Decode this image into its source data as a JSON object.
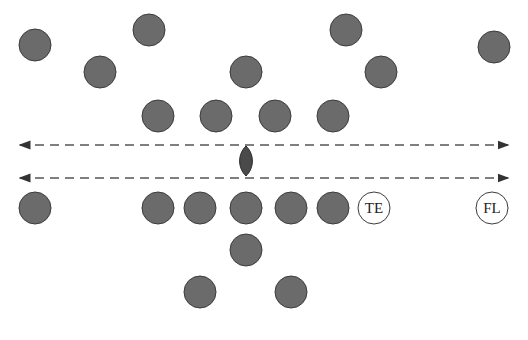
{
  "diagram": {
    "type": "football-formation",
    "colors": {
      "player_fill": "#6b6b6b",
      "player_border": "#3c3c3c",
      "line": "#555555",
      "ball": "#4a4a4a"
    },
    "scrimmage_lines": [
      {
        "y": 145,
        "x1": 20,
        "x2": 508,
        "style": "dashed",
        "arrows": "both"
      },
      {
        "y": 178,
        "x1": 20,
        "x2": 508,
        "style": "dashed",
        "arrows": "both"
      }
    ],
    "ball": {
      "x": 246,
      "y": 161
    },
    "defense": [
      {
        "x": 35,
        "y": 45
      },
      {
        "x": 149,
        "y": 30
      },
      {
        "x": 100,
        "y": 72
      },
      {
        "x": 246,
        "y": 72
      },
      {
        "x": 346,
        "y": 30
      },
      {
        "x": 381,
        "y": 72
      },
      {
        "x": 494,
        "y": 47
      },
      {
        "x": 158,
        "y": 116
      },
      {
        "x": 216,
        "y": 116
      },
      {
        "x": 275,
        "y": 116
      },
      {
        "x": 333,
        "y": 116
      }
    ],
    "offense": [
      {
        "x": 35,
        "y": 208,
        "label": ""
      },
      {
        "x": 158,
        "y": 208,
        "label": ""
      },
      {
        "x": 200,
        "y": 208,
        "label": ""
      },
      {
        "x": 246,
        "y": 208,
        "label": ""
      },
      {
        "x": 291,
        "y": 208,
        "label": ""
      },
      {
        "x": 333,
        "y": 208,
        "label": ""
      },
      {
        "x": 374,
        "y": 208,
        "label": "TE"
      },
      {
        "x": 492,
        "y": 208,
        "label": "FL"
      },
      {
        "x": 246,
        "y": 250,
        "label": ""
      },
      {
        "x": 200,
        "y": 292,
        "label": ""
      },
      {
        "x": 291,
        "y": 292,
        "label": ""
      }
    ]
  }
}
